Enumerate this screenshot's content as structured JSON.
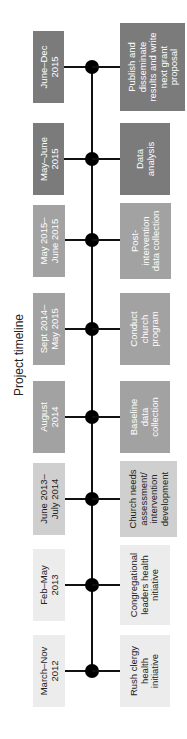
{
  "title": "Project timeline",
  "colors": {
    "dark": "#7b7b7b",
    "medium": "#a2a2a2",
    "light": "#cfcfcf",
    "lightest": "#ececec",
    "line": "#111111",
    "node": "#000000"
  },
  "milestones": [
    {
      "date": "June–Dec\n2015",
      "activity": "Publish and\ndisseminate\nresults and write\nnext grant\nproposal",
      "shade": "dark"
    },
    {
      "date": "May–June\n2015",
      "activity": "Data\nanalysis",
      "shade": "dark"
    },
    {
      "date": "May 2015–\nJune 2015",
      "activity": "Post-\nintervention\ndata collection",
      "shade": "medium"
    },
    {
      "date": "Sept 2014–\nMay 2015",
      "activity": "Conduct\nchurch\nprogram",
      "shade": "medium"
    },
    {
      "date": "August\n2014",
      "activity": "Baseline\ndata\ncollection",
      "shade": "medium"
    },
    {
      "date": "June 2013–\nJuly 2014",
      "activity": "Church needs\nassessment/\nintervention\ndevelopment",
      "shade": "light"
    },
    {
      "date": "Feb–May\n2013",
      "activity": "Congregational\nleaders health\nnitiative",
      "shade": "lightest"
    },
    {
      "date": "March–Nov\n2012",
      "activity": "Rush clergy\nhealth\ninitiative",
      "shade": "lightest"
    }
  ]
}
